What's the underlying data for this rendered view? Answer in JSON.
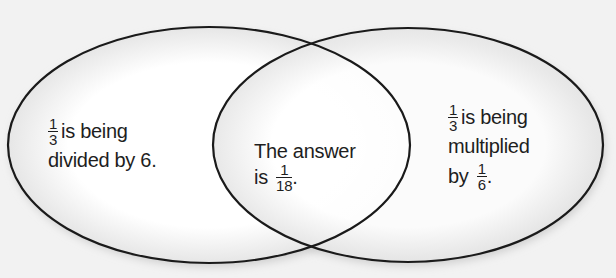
{
  "diagram": {
    "type": "venn",
    "colors": {
      "stroke": "#1a1a1a",
      "fill": "#ffffff",
      "background": "#f2f2f2",
      "text": "#1e1e1e"
    },
    "left_set": {
      "fraction": {
        "numerator": "1",
        "denominator": "3"
      },
      "line1_text": "is being",
      "line2_text": "divided by 6."
    },
    "intersection": {
      "line1_text": "The answer",
      "line2_prefix": "is",
      "fraction": {
        "numerator": "1",
        "denominator": "18"
      },
      "line2_suffix": "."
    },
    "right_set": {
      "fraction": {
        "numerator": "1",
        "denominator": "3"
      },
      "line1_text": "is being",
      "line2_text": "multiplied",
      "line3_prefix": "by",
      "line3_fraction": {
        "numerator": "1",
        "denominator": "6"
      },
      "line3_suffix": "."
    }
  }
}
